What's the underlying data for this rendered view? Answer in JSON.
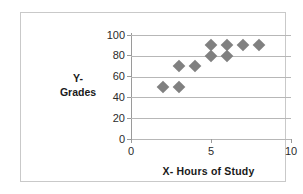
{
  "chart_data": {
    "type": "scatter",
    "title": "",
    "xlabel": "X- Hours of Study",
    "ylabel_line1": "Y-",
    "ylabel_line2": "Grades",
    "ylabel": "Y- Grades",
    "xlim": [
      0,
      10
    ],
    "ylim": [
      0,
      100
    ],
    "x_ticks": [
      0,
      5,
      10
    ],
    "x_tick_labels": [
      "0",
      "5",
      "10"
    ],
    "y_ticks": [
      0,
      20,
      40,
      60,
      80,
      100
    ],
    "y_tick_labels": [
      "0",
      "20",
      "40",
      "60",
      "80",
      "100"
    ],
    "grid": "horizontal",
    "legend": "none",
    "marker_shape": "diamond",
    "marker_color": "#808080",
    "points": [
      {
        "x": 2,
        "y": 50
      },
      {
        "x": 3,
        "y": 50
      },
      {
        "x": 3,
        "y": 70
      },
      {
        "x": 4,
        "y": 70
      },
      {
        "x": 5,
        "y": 80
      },
      {
        "x": 5,
        "y": 90
      },
      {
        "x": 6,
        "y": 80
      },
      {
        "x": 6,
        "y": 90
      },
      {
        "x": 7,
        "y": 90
      },
      {
        "x": 8,
        "y": 90
      }
    ],
    "x": [
      2,
      3,
      3,
      4,
      5,
      5,
      6,
      6,
      7,
      8
    ],
    "values": [
      50,
      50,
      70,
      70,
      80,
      90,
      80,
      90,
      90,
      90
    ]
  },
  "colors": {
    "marker": "#808080",
    "gridline": "#b7b7b7",
    "axis": "#9a9a9a",
    "frame": "#c9c9c9",
    "text": "#1a1a1a",
    "background": "#ffffff"
  }
}
